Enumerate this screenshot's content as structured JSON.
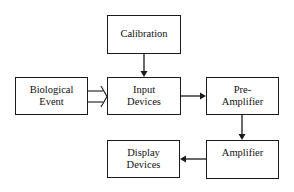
{
  "diagram": {
    "type": "block-diagram",
    "nodes": [
      {
        "id": "calibration",
        "lines": [
          "Calibration"
        ]
      },
      {
        "id": "biological_event",
        "lines": [
          "Biological",
          "Event"
        ]
      },
      {
        "id": "input_devices",
        "lines": [
          "Input",
          "Devices"
        ]
      },
      {
        "id": "pre_amplifier",
        "lines": [
          "Pre-",
          "Amplifier"
        ]
      },
      {
        "id": "amplifier",
        "lines": [
          "Amplifier"
        ]
      },
      {
        "id": "display_devices",
        "lines": [
          "Display",
          "Devices"
        ]
      }
    ],
    "edges": [
      {
        "from": "calibration",
        "to": "input_devices",
        "style": "solid-arrow"
      },
      {
        "from": "biological_event",
        "to": "input_devices",
        "style": "hollow-double-arrow"
      },
      {
        "from": "input_devices",
        "to": "pre_amplifier",
        "style": "solid-arrow"
      },
      {
        "from": "pre_amplifier",
        "to": "amplifier",
        "style": "solid-arrow"
      },
      {
        "from": "amplifier",
        "to": "display_devices",
        "style": "solid-arrow"
      }
    ]
  },
  "labels": {
    "calibration": "Calibration",
    "biological_1": "Biological",
    "biological_2": "Event",
    "input_1": "Input",
    "input_2": "Devices",
    "pre_1": "Pre-",
    "pre_2": "Amplifier",
    "amplifier": "Amplifier",
    "display_1": "Display",
    "display_2": "Devices"
  },
  "colors": {
    "stroke": "#1a1a1a",
    "background": "#ffffff"
  }
}
